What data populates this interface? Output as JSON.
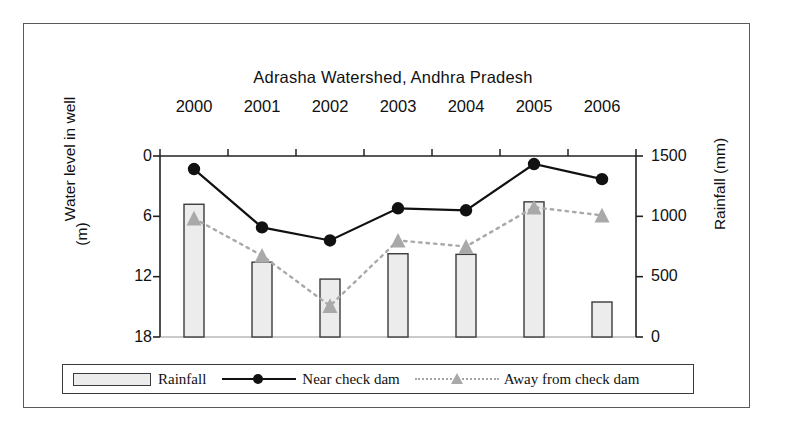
{
  "chart_data": {
    "type": "bar",
    "title": "Adrasha Watershed, Andhra Pradesh",
    "categories": [
      "2000",
      "2001",
      "2002",
      "2003",
      "2004",
      "2005",
      "2006"
    ],
    "xlabel": "",
    "ylabel": "Water level in well (m)",
    "y2label": "Rainfall (mm)",
    "ylim": [
      18,
      0
    ],
    "y2lim": [
      0,
      1500
    ],
    "yticks": [
      "0",
      "6",
      "12",
      "18"
    ],
    "ytick_values": [
      0,
      6,
      12,
      18
    ],
    "y2ticks": [
      "0",
      "500",
      "1000",
      "1500"
    ],
    "y2tick_values": [
      0,
      500,
      1000,
      1500
    ],
    "y_inverted": true,
    "grid": false,
    "legend_position": "bottom",
    "series": [
      {
        "name": "Rainfall",
        "kind": "bar",
        "axis": "right",
        "unit": "mm",
        "color": "#ececec",
        "edge_color": "#3b3b3b",
        "values": [
          1100,
          620,
          480,
          690,
          685,
          1120,
          290
        ]
      },
      {
        "name": "Near check dam",
        "kind": "line",
        "axis": "left",
        "unit": "m",
        "color": "#111111",
        "marker": "circle",
        "linestyle": "solid",
        "values": [
          1.3,
          7.1,
          8.4,
          5.2,
          5.4,
          0.8,
          2.3
        ]
      },
      {
        "name": "Away from check dam",
        "kind": "line",
        "axis": "left",
        "unit": "m",
        "color": "#a9a9a9",
        "marker": "triangle",
        "linestyle": "dotted",
        "values": [
          6.2,
          9.9,
          14.9,
          8.4,
          9.0,
          5.1,
          5.9
        ]
      }
    ]
  },
  "legend": {
    "items": [
      {
        "label": "Rainfall",
        "marker": "bar-swatch"
      },
      {
        "label": "Near check dam",
        "marker": "solid-line-circle"
      },
      {
        "label": "Away from check dam",
        "marker": "dotted-line-triangle"
      }
    ]
  },
  "caption_fragment": ""
}
